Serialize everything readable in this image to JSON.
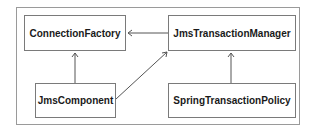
{
  "diagram": {
    "nodes": [
      {
        "id": "connection-factory",
        "label": "ConnectionFactory"
      },
      {
        "id": "jms-transaction-manager",
        "label": "JmsTransactionManager"
      },
      {
        "id": "jms-component",
        "label": "JmsComponent"
      },
      {
        "id": "spring-transaction-policy",
        "label": "SpringTransactionPolicy"
      }
    ],
    "edges": [
      {
        "from": "jms-transaction-manager",
        "to": "connection-factory"
      },
      {
        "from": "jms-component",
        "to": "connection-factory"
      },
      {
        "from": "jms-component",
        "to": "jms-transaction-manager"
      },
      {
        "from": "spring-transaction-policy",
        "to": "jms-transaction-manager"
      }
    ],
    "colors": {
      "line": "#555555",
      "border": "#7a7a7a",
      "frame": "#9a9a9a"
    }
  }
}
